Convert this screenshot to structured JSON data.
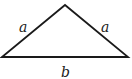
{
  "diagram": {
    "type": "isosceles-triangle",
    "stroke_color": "#1a1a1a",
    "background": "#ffffff",
    "vertices": {
      "apex": [
        65,
        5
      ],
      "left_base": [
        2,
        57
      ],
      "right_base": [
        128,
        57
      ]
    },
    "labels": {
      "left_side": "a",
      "right_side": "a",
      "base": "b"
    }
  }
}
